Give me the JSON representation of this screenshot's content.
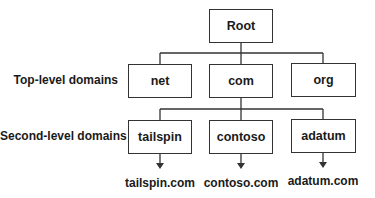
{
  "diagram": {
    "root": {
      "label": "Root"
    },
    "row_labels": {
      "top_level": "Top-level domains",
      "second_level": "Second-level domains"
    },
    "top_level_domains": [
      {
        "label": "net"
      },
      {
        "label": "com"
      },
      {
        "label": "org"
      }
    ],
    "second_level_domains": [
      {
        "label": "tailspin",
        "fqdn": "tailspin.com"
      },
      {
        "label": "contoso",
        "fqdn": "contoso.com"
      },
      {
        "label": "adatum",
        "fqdn": "adatum.com"
      }
    ],
    "colors": {
      "line": "#333333",
      "text": "#1a1a1a",
      "background": "#ffffff"
    }
  }
}
